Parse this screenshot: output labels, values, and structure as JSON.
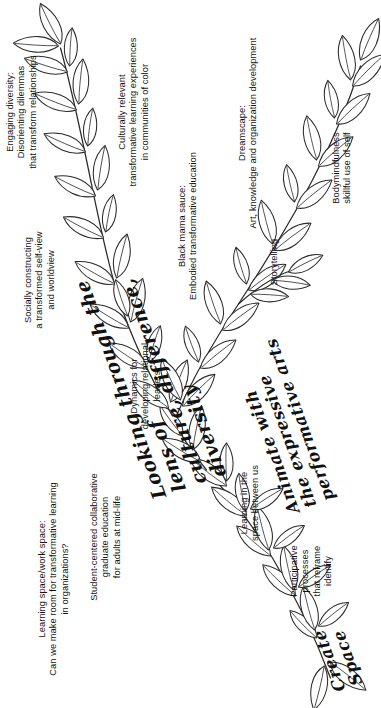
{
  "poster": {
    "type": "hand-drawn branching vine mind-map",
    "orientation": "rotated 90 degrees counter-clockwise; text reads bottom-to-top",
    "ink_color": "#2b2b2b",
    "background_color": "#ffffff"
  },
  "headings": {
    "main_title": "Looking through the lens of\nculture, difference, diversity",
    "branch_create_space": "Create\nSpace",
    "branch_animate": "Animate with\nthe expressive\nperformative arts"
  },
  "labels": {
    "learning_space": "Learning space/work space:\nCan we make room for transformative learning\nin organizations?",
    "student_centered": "Student-centered collaborative\ngraduate education\nfor adults at mid-life",
    "socially_constructing": "Socially constructing\na transformed self-view\nand worldview",
    "engaging_diversity": "Engaging diversity:\nDisorienting dilemmas\nthat transform relationships",
    "dynamics": "Dynamics for\ndeveloping relational\nleaders",
    "culturally_relevant": "Culturally relevant\ntransformative learning experiences\nin communities of color",
    "participative": "Participative\nprocesses\nthat reframe\nidentify",
    "learning_between": "Learning in the\nspace between us",
    "black_mama_sauce": "Black mama sauce:\nEmbodied transformative education",
    "storytelling": "Storytelling",
    "dreamscape": "Dreamscape:\nArt, knowledge and organization development",
    "bodymindfulness": "Bodymindfulness\nskillful use of self"
  }
}
